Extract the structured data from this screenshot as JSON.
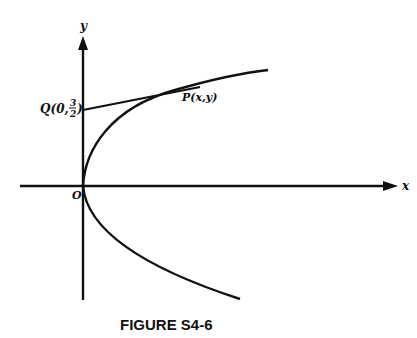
{
  "figure": {
    "caption": "FIGURE S4-6",
    "axes": {
      "x_label": "x",
      "y_label": "y",
      "origin_label": "O"
    },
    "points": {
      "Q": {
        "label": "Q(0,",
        "frac_num": "3",
        "frac_den": "2",
        "close": ")"
      },
      "P": {
        "label": "P(x,y)"
      }
    },
    "curve": "parabola opening right with vertex at origin; tangent line from Q to P"
  }
}
